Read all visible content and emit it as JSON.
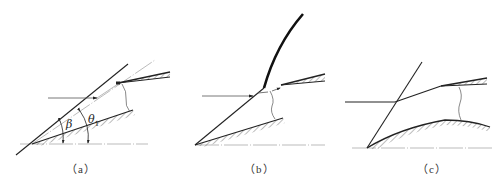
{
  "figure": {
    "panels": [
      {
        "id": "a",
        "caption": "（a）",
        "angle_labels": {
          "beta": "β",
          "theta": "θ",
          "theta_sub": "1"
        }
      },
      {
        "id": "b",
        "caption": "（b）"
      },
      {
        "id": "c",
        "caption": "（c）"
      }
    ],
    "colors": {
      "line": "#222222",
      "thin": "#555555",
      "baseline": "#aaaaaa",
      "hatch": "#555555"
    }
  }
}
